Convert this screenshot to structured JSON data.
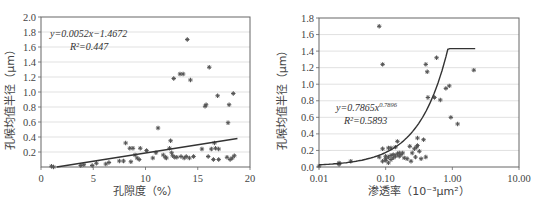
{
  "chart_data": [
    {
      "type": "scatter",
      "title": "",
      "xlabel": "孔隙度（%）",
      "ylabel": "孔喉均值半径（μm）",
      "xlim": [
        0,
        20
      ],
      "ylim": [
        0,
        2.0
      ],
      "x_ticks": [
        "0",
        "5",
        "10",
        "15",
        "20"
      ],
      "y_ticks": [
        "0.2",
        "0.4",
        "0.6",
        "0.8",
        "1.0",
        "1.2",
        "1.4",
        "1.6",
        "1.8",
        "2.0"
      ],
      "grid": true,
      "trendline": {
        "type": "linear",
        "equation": "y=0.0052x−1.4672",
        "r2": "R²=0.447"
      },
      "points": [
        [
          1.0,
          0.01
        ],
        [
          1.2,
          0.0
        ],
        [
          3.8,
          0.02
        ],
        [
          4.1,
          0.03
        ],
        [
          4.9,
          0.02
        ],
        [
          5.3,
          0.05
        ],
        [
          6.2,
          0.04
        ],
        [
          6.5,
          0.06
        ],
        [
          7.5,
          0.08
        ],
        [
          7.9,
          0.08
        ],
        [
          8.1,
          0.32
        ],
        [
          8.5,
          0.25
        ],
        [
          8.6,
          0.07
        ],
        [
          8.8,
          0.25
        ],
        [
          9.0,
          0.16
        ],
        [
          9.2,
          0.12
        ],
        [
          9.4,
          0.1
        ],
        [
          9.5,
          0.25
        ],
        [
          10.1,
          0.22
        ],
        [
          10.7,
          0.12
        ],
        [
          11.0,
          0.19
        ],
        [
          11.2,
          0.52
        ],
        [
          11.7,
          0.16
        ],
        [
          11.9,
          0.13
        ],
        [
          12.0,
          0.12
        ],
        [
          12.3,
          0.25
        ],
        [
          12.4,
          0.35
        ],
        [
          12.5,
          0.19
        ],
        [
          12.6,
          0.15
        ],
        [
          12.7,
          1.18
        ],
        [
          12.8,
          0.13
        ],
        [
          13.0,
          0.13
        ],
        [
          13.3,
          1.24
        ],
        [
          13.4,
          0.14
        ],
        [
          13.6,
          1.24
        ],
        [
          13.7,
          0.12
        ],
        [
          13.9,
          0.14
        ],
        [
          14.0,
          1.7
        ],
        [
          14.2,
          0.12
        ],
        [
          14.3,
          1.16
        ],
        [
          14.6,
          0.14
        ],
        [
          15.4,
          0.24
        ],
        [
          15.7,
          0.81
        ],
        [
          15.8,
          0.83
        ],
        [
          16.0,
          0.14
        ],
        [
          16.1,
          1.33
        ],
        [
          16.3,
          0.24
        ],
        [
          16.5,
          0.1
        ],
        [
          16.6,
          0.32
        ],
        [
          16.7,
          0.25
        ],
        [
          16.9,
          0.95
        ],
        [
          17.0,
          0.24
        ],
        [
          17.0,
          0.1
        ],
        [
          17.8,
          0.13
        ],
        [
          17.9,
          0.59
        ],
        [
          18.0,
          0.83
        ],
        [
          18.1,
          0.1
        ],
        [
          18.3,
          0.12
        ],
        [
          18.4,
          0.98
        ],
        [
          18.5,
          0.15
        ]
      ],
      "line_endpoints": [
        [
          1.5,
          0.0
        ],
        [
          18.8,
          0.38
        ]
      ]
    },
    {
      "type": "scatter",
      "title": "",
      "xlabel": "渗透率（10⁻³μm²）",
      "ylabel": "孔喉均值半径（μm）",
      "xscale": "log",
      "xlim": [
        0.01,
        10.0
      ],
      "ylim": [
        0.0,
        1.8
      ],
      "x_ticks": [
        "0.01",
        "0.10",
        "1.00",
        "10.00"
      ],
      "y_ticks": [
        "0.0",
        "0.2",
        "0.4",
        "0.6",
        "0.8",
        "1.0",
        "1.2",
        "1.4",
        "1.6",
        "1.8"
      ],
      "grid": true,
      "trendline": {
        "type": "power",
        "equation": "y=0.7865x^0.7896",
        "r2": "R²=0.5893"
      },
      "points": [
        [
          0.01,
          0.01
        ],
        [
          0.02,
          0.03
        ],
        [
          0.02,
          0.05
        ],
        [
          0.03,
          0.07
        ],
        [
          0.08,
          0.12
        ],
        [
          0.08,
          1.7
        ],
        [
          0.09,
          1.24
        ],
        [
          0.09,
          0.07
        ],
        [
          0.09,
          0.22
        ],
        [
          0.1,
          0.1
        ],
        [
          0.1,
          0.08
        ],
        [
          0.1,
          0.13
        ],
        [
          0.11,
          0.05
        ],
        [
          0.11,
          0.23
        ],
        [
          0.11,
          0.12
        ],
        [
          0.12,
          0.23
        ],
        [
          0.12,
          0.09
        ],
        [
          0.12,
          0.14
        ],
        [
          0.13,
          0.11
        ],
        [
          0.13,
          0.15
        ],
        [
          0.14,
          0.13
        ],
        [
          0.14,
          0.24
        ],
        [
          0.15,
          0.16
        ],
        [
          0.15,
          0.31
        ],
        [
          0.16,
          0.17
        ],
        [
          0.16,
          0.13
        ],
        [
          0.17,
          0.15
        ],
        [
          0.18,
          0.17
        ],
        [
          0.19,
          0.11
        ],
        [
          0.21,
          0.1
        ],
        [
          0.23,
          0.25
        ],
        [
          0.24,
          0.07
        ],
        [
          0.25,
          0.17
        ],
        [
          0.27,
          0.22
        ],
        [
          0.28,
          0.12
        ],
        [
          0.29,
          0.24
        ],
        [
          0.3,
          0.26
        ],
        [
          0.3,
          0.35
        ],
        [
          0.32,
          0.19
        ],
        [
          0.34,
          0.1
        ],
        [
          0.37,
          0.33
        ],
        [
          0.4,
          0.12
        ],
        [
          0.4,
          1.24
        ],
        [
          0.42,
          1.15
        ],
        [
          0.43,
          0.84
        ],
        [
          0.54,
          0.84
        ],
        [
          0.58,
          1.32
        ],
        [
          0.66,
          0.81
        ],
        [
          0.8,
          0.95
        ],
        [
          0.9,
          0.98
        ],
        [
          0.95,
          0.6
        ],
        [
          1.2,
          0.52
        ],
        [
          2.1,
          1.17
        ]
      ],
      "curve": {
        "a": 0.7865,
        "b": 0.7896,
        "x_range": [
          0.01,
          2.2
        ]
      }
    }
  ]
}
